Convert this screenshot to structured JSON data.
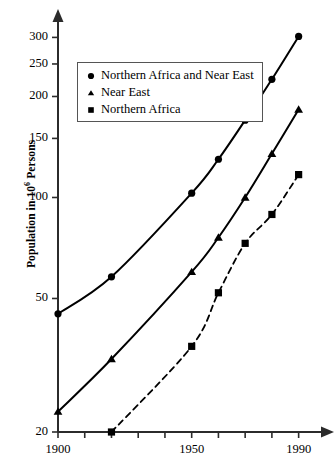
{
  "chart_data": {
    "type": "line",
    "title": "",
    "subtitle": "",
    "xlabel": "",
    "ylabel": "Population in 10⁶ Persons",
    "ylabel_prefix": "Population in 10",
    "ylabel_exponent": "6",
    "ylabel_suffix": " Persons",
    "yscale": "log",
    "xlim": [
      1900,
      1995
    ],
    "ylim": [
      20,
      320
    ],
    "grid": false,
    "legend_position": "upper-left",
    "x": [
      1900,
      1920,
      1950,
      1960,
      1970,
      1980,
      1990
    ],
    "x_ticks": [
      1900,
      1910,
      1920,
      1930,
      1940,
      1950,
      1960,
      1970,
      1980,
      1990
    ],
    "x_tick_labels": [
      "1900",
      "",
      "",
      "",
      "",
      "1950",
      "",
      "",
      "",
      "1990"
    ],
    "y_ticks": [
      20,
      50,
      100,
      150,
      200,
      250,
      300
    ],
    "y_tick_labels": [
      "20",
      "50",
      "100",
      "150",
      "200",
      "250",
      "300"
    ],
    "series": [
      {
        "name": "Northern Africa and Near East",
        "marker": "circle",
        "linestyle": "solid",
        "color": "#000000",
        "x": [
          1900,
          1920,
          1950,
          1960,
          1970,
          1980,
          1990
        ],
        "values": [
          45,
          58,
          103,
          130,
          170,
          225,
          302
        ]
      },
      {
        "name": "Near East",
        "marker": "triangle",
        "linestyle": "solid",
        "color": "#000000",
        "x": [
          1900,
          1920,
          1950,
          1960,
          1970,
          1980,
          1990
        ],
        "values": [
          23,
          33,
          60,
          76,
          100,
          135,
          183
        ]
      },
      {
        "name": "Northern Africa",
        "marker": "square",
        "linestyle": "dashed",
        "color": "#000000",
        "x": [
          1920,
          1950,
          1960,
          1970,
          1980,
          1990
        ],
        "values": [
          20,
          36,
          52,
          73,
          89,
          117
        ]
      }
    ]
  },
  "legend": {
    "items": [
      {
        "marker": "circle",
        "label": "Northern Africa and Near East"
      },
      {
        "marker": "triangle",
        "label": "Near East"
      },
      {
        "marker": "square",
        "label": "Northern Africa"
      }
    ]
  },
  "colors": {
    "ink": "#000000",
    "axis": "#333333",
    "legend_border": "#555555",
    "background": "#ffffff"
  }
}
